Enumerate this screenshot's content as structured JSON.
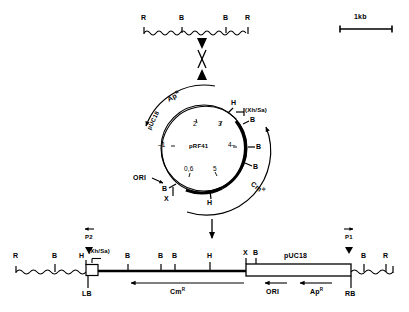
{
  "figure": {
    "scale_bar": {
      "label": "1kb"
    }
  },
  "top_line": {
    "name": "genomic-fragment",
    "sites": [
      {
        "label": "R",
        "x": 144
      },
      {
        "label": "B",
        "x": 182
      },
      {
        "label": "B",
        "x": 226
      },
      {
        "label": "R",
        "x": 248
      }
    ]
  },
  "crossover": {
    "symbol": "X",
    "name": "recombination-crossover"
  },
  "plasmid": {
    "name": "pRF41",
    "center_label": "pRF41",
    "arc_labels": [
      {
        "label": "Ap",
        "sup": "R"
      },
      {
        "label": "pUC18",
        "sup": ""
      },
      {
        "label": "Cm",
        "sup": "R"
      },
      {
        "label": "ORI",
        "sup": ""
      }
    ],
    "tick_numbers": [
      "1",
      "2",
      "3",
      "4",
      "5",
      "0,6"
    ],
    "sites": [
      {
        "label": "H"
      },
      {
        "label": "(Xh/Sa)"
      },
      {
        "label": "B"
      },
      {
        "label": "B"
      },
      {
        "label": "B"
      },
      {
        "label": "H"
      },
      {
        "label": "X"
      },
      {
        "label": "B"
      }
    ]
  },
  "bottom_map": {
    "name": "linearized-integrated-construct",
    "primers": [
      {
        "label": "P2",
        "x": 88
      },
      {
        "label": "P1",
        "x": 348
      }
    ],
    "sites": [
      {
        "label": "R",
        "x": 16
      },
      {
        "label": "B",
        "x": 55
      },
      {
        "label": "H",
        "x": 83
      },
      {
        "label": "(Xh/Sa)",
        "x": 90
      },
      {
        "label": "B",
        "x": 128
      },
      {
        "label": "B",
        "x": 161
      },
      {
        "label": "B",
        "x": 175
      },
      {
        "label": "H",
        "x": 210
      },
      {
        "label": "X",
        "x": 245
      },
      {
        "label": "B",
        "x": 256
      },
      {
        "label": "B",
        "x": 364
      },
      {
        "label": "R",
        "x": 386
      }
    ],
    "box_label": "pUC18",
    "border_labels": [
      {
        "label": "LB",
        "x": 84
      },
      {
        "label": "RB",
        "x": 352
      }
    ],
    "genes": [
      {
        "label": "Cm",
        "sup": "R",
        "x": 180
      },
      {
        "label": "ORI",
        "sup": "",
        "x": 274
      },
      {
        "label": "Ap",
        "sup": "R",
        "x": 318
      }
    ]
  }
}
